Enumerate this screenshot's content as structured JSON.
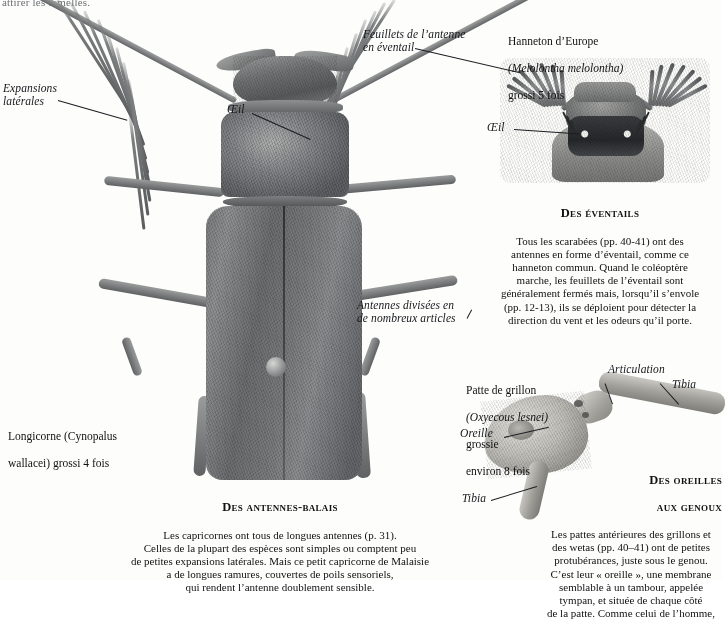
{
  "page": {
    "clipped_top_text": "attirer les femelles.",
    "background": "#fdfdfc",
    "ink": "#111111"
  },
  "labels": {
    "expansions_laterales": "Expansions\nlatérales",
    "oeil_left": "Œil",
    "feuillets": "Feuillets de l’antenne\nen éventail",
    "oeil_right": "Œil",
    "antennes_divisees": "Antennes divisées en\nde nombreux articles",
    "articulation": "Articulation",
    "tibia_upper": "Tibia",
    "oreille": "Oreille",
    "tibia_lower": "Tibia"
  },
  "specimens": {
    "chafer": {
      "common_name": "Hanneton d’Europe",
      "scientific_name": "(Melolontha melolontha)",
      "magnification": "grossi 5 fois"
    },
    "longhorn": {
      "caption_line1": "Longicorne (Cynopalus",
      "caption_line2": "wallacei) grossi 4 fois",
      "common_name": "Longicorne",
      "scientific_name": "(Cynopalus wallacei)",
      "magnification": "grossi 4 fois"
    },
    "cricket": {
      "common_name": "Patte de grillon",
      "scientific_name": "(Oxyecous lesnei)",
      "magnification_line1": "grossie",
      "magnification_line2": "environ 8 fois"
    }
  },
  "captions": {
    "eventails": {
      "title": "Des éventails",
      "body": "Tous les scarabées (pp. 40-41) ont des\nantennes en forme d’éventail, comme ce\nhanneton commun. Quand le coléoptère\nmarche, les feuillets de l’éventail sont\ngénéralement fermés mais, lorsqu’il s’envole\n(pp. 12-13), ils se déploient pour détecter la\ndirection du vent et les odeurs qu’il porte."
    },
    "antennes_balais": {
      "title": "Des antennes-balais",
      "body": "Les capricornes ont tous de longues antennes (p. 31).\nCelles de la plupart des espèces sont simples ou comptent peu\nde petites expansions latérales. Mais ce petit capricorne de Malaisie\na de longues ramures, couvertes de poils sensoriels,\nqui rendent l’antenne doublement sensible."
    },
    "oreilles_genoux": {
      "title_line1": "Des oreilles",
      "title_line2": "aux genoux",
      "body": "Les pattes antérieures des grillons et\ndes wetas (pp. 40–41) ont de petites\nprotubérances, juste sous le genou.\nC’est leur « oreille », une membrane\nsemblable à un tambour, appelée\ntympan, et située de chaque côté\nde la patte. Comme celui de l’homme,"
    }
  }
}
